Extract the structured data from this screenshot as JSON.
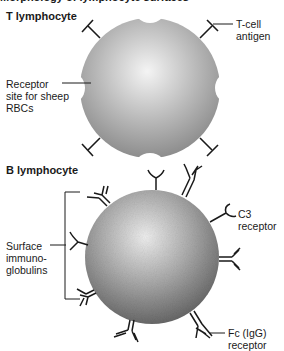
{
  "figure": {
    "cut_title": "Morphology of lymphocyte surfaces",
    "t_section": {
      "heading": "T lymphocyte",
      "labels": {
        "t_cell_antigen_line1": "T-cell",
        "t_cell_antigen_line2": "antigen",
        "receptor_line1": "Receptor",
        "receptor_line2": "site for sheep",
        "receptor_line3": "RBCs"
      }
    },
    "b_section": {
      "heading": "B lymphocyte",
      "labels": {
        "c3_line1": "C3",
        "c3_line2": "receptor",
        "surface_line1": "Surface",
        "surface_line2": "immuno-",
        "surface_line3": "globulins",
        "fc_line1": "Fc (IgG)",
        "fc_line2": "receptor"
      }
    },
    "colors": {
      "cell_light": "#f2f2f2",
      "cell_dark": "#7a7a7a",
      "line": "#1a1a1a"
    }
  }
}
